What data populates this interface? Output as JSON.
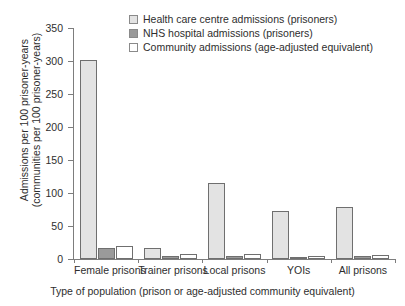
{
  "chart_data": {
    "type": "bar",
    "title": "",
    "xlabel": "Type of population (prison or age-adjusted community equivalent)",
    "ylabel": "Admissions per 100 prisoner-years (communities per 100 prisoner-years)",
    "ylabel_line1": "Admissions per 100 prisoner-years",
    "ylabel_line2": "(communities per 100 prisoner-years)",
    "categories": [
      "Female prisons",
      "Trainer prisons",
      "Local prisons",
      "YOIs",
      "All prisons"
    ],
    "series": [
      {
        "name": "Health care centre admissions (prisoners)",
        "color": "#e3e3e3",
        "values": [
          302,
          17,
          115,
          73,
          79
        ]
      },
      {
        "name": "NHS hospital admissions (prisoners)",
        "color": "#9a9a9a",
        "values": [
          16,
          5,
          5,
          3,
          5
        ]
      },
      {
        "name": "Community admissions (age-adjusted equivalent)",
        "color": "#ffffff",
        "values": [
          20,
          7,
          7,
          5,
          6
        ]
      }
    ],
    "ylim": [
      0,
      350
    ],
    "yticks": [
      0,
      50,
      100,
      150,
      200,
      250,
      300,
      350
    ],
    "ytick_labels": [
      "0",
      "50",
      "100",
      "150",
      "200",
      "250",
      "300",
      "350"
    ],
    "grid": false,
    "legend_position": "top-right",
    "axis_color": "#7d7d7d",
    "bar_outline_color": "#6f6f6f"
  }
}
